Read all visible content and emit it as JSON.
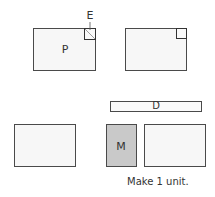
{
  "diagram": {
    "panel_p": {
      "label": "P"
    },
    "callout_e": {
      "label": "E"
    },
    "bar_d": {
      "label": "D"
    },
    "panel_m": {
      "label": "M"
    },
    "caption": "Make 1 unit."
  },
  "colors": {
    "outline": "#4a4a4a",
    "panel_fill": "#f7f7f7",
    "m_fill": "#c9c9c9"
  }
}
